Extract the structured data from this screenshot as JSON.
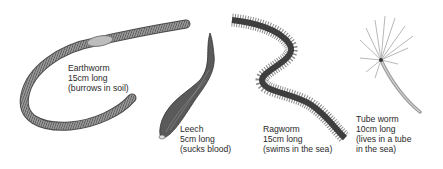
{
  "figure": {
    "worms": [
      {
        "id": "earthworm",
        "name": "Earthworm",
        "length": "15cm long",
        "note": "(burrows in soil)"
      },
      {
        "id": "leech",
        "name": "Leech",
        "length": "5cm long",
        "note": "(sucks blood)"
      },
      {
        "id": "ragworm",
        "name": "Ragworm",
        "length": "15cm long",
        "note": "(swims in the sea)"
      },
      {
        "id": "tube-worm",
        "name": "Tube worm",
        "length": "10cm long",
        "note_line1": "(lives in a tube",
        "note_line2": "in the sea)"
      }
    ],
    "colors": {
      "background": "#ffffff",
      "illustration": "#6e6e6e",
      "text": "#2a2a2a"
    }
  }
}
